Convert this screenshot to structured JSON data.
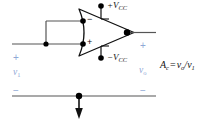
{
  "figure": {
    "type": "circuit-schematic",
    "colors": {
      "wire": "#555555",
      "node": "#000000",
      "text_dark": "#111111",
      "text_blue": "#8fa8d6"
    }
  },
  "opamp": {
    "inverting_input_label": "−",
    "noninverting_input_label": "+",
    "positive_supply_label": "+V",
    "positive_supply_sub": "CC",
    "negative_supply_label": "−V",
    "negative_supply_sub": "CC"
  },
  "ports": {
    "input_plus": "+",
    "input_minus": "−",
    "output_plus": "+",
    "output_minus": "−",
    "input_signal": "v",
    "input_signal_sub": "1",
    "output_signal": "v",
    "output_signal_sub": "o"
  },
  "annotation": {
    "gain_symbol": "A",
    "gain_sub": "c",
    "equals": "=",
    "numerator": "v",
    "numerator_sub": "o",
    "slash": "/",
    "denominator": "v",
    "denominator_sub": "1"
  }
}
